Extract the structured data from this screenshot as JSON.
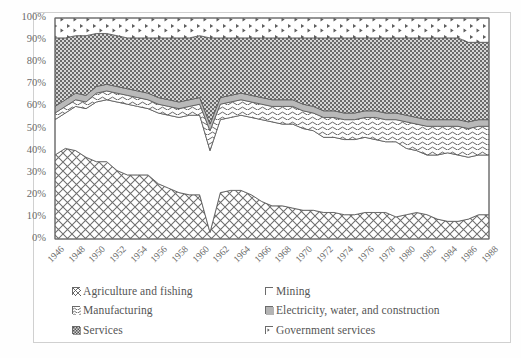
{
  "figure": {
    "background_color": "#ffffff",
    "frame_color": "#d0d0d0"
  },
  "chart_data": {
    "type": "area",
    "subtype": "stacked-percentage-area",
    "title": "",
    "xlabel": "",
    "ylabel": "",
    "ylim": [
      0,
      100
    ],
    "ytick_labels": [
      "0%",
      "10%",
      "20%",
      "30%",
      "40%",
      "50%",
      "60%",
      "70%",
      "80%",
      "90%",
      "100%"
    ],
    "ytick_values": [
      0,
      10,
      20,
      30,
      40,
      50,
      60,
      70,
      80,
      90,
      100
    ],
    "grid": false,
    "legend_position": "bottom",
    "x": [
      1946,
      1947,
      1948,
      1949,
      1950,
      1951,
      1952,
      1953,
      1954,
      1955,
      1956,
      1957,
      1958,
      1959,
      1960,
      1961,
      1962,
      1963,
      1964,
      1965,
      1966,
      1967,
      1968,
      1969,
      1970,
      1971,
      1972,
      1973,
      1974,
      1975,
      1976,
      1977,
      1978,
      1979,
      1980,
      1981,
      1982,
      1983,
      1984,
      1985,
      1986,
      1987,
      1988
    ],
    "xtick_labels": [
      "1946",
      "1948",
      "1950",
      "1952",
      "1954",
      "1956",
      "1958",
      "1960",
      "1962",
      "1964",
      "1966",
      "1968",
      "1970",
      "1972",
      "1974",
      "1976",
      "1978",
      "1980",
      "1982",
      "1984",
      "1986",
      "1988"
    ],
    "series": [
      {
        "name": "Agriculture and fishing",
        "pattern": "diagonal-cross-hatch",
        "color": "#ffffff",
        "values": [
          38,
          41,
          40,
          37,
          35,
          35,
          31,
          29,
          29,
          29,
          25,
          23,
          21,
          20,
          20,
          3,
          21,
          22,
          22,
          20,
          17,
          15,
          15,
          14,
          13,
          13,
          12,
          12,
          11,
          11,
          12,
          12,
          12,
          10,
          11,
          12,
          11,
          9,
          8,
          8,
          9,
          11,
          11
        ]
      },
      {
        "name": "Mining",
        "pattern": "solid-white",
        "color": "#ffffff",
        "values": [
          16,
          16,
          20,
          22,
          27,
          28,
          31,
          32,
          31,
          30,
          32,
          33,
          34,
          36,
          36,
          37,
          33,
          33,
          34,
          35,
          37,
          38,
          37,
          38,
          37,
          36,
          34,
          34,
          34,
          34,
          34,
          33,
          32,
          34,
          30,
          28,
          27,
          29,
          31,
          30,
          28,
          27,
          27
        ]
      },
      {
        "name": "Manufacturing",
        "pattern": "wavy-lines",
        "color": "#fdfdfd",
        "values": [
          3,
          3,
          3,
          3,
          4,
          4,
          4,
          4,
          4,
          4,
          4,
          4,
          4,
          4,
          5,
          9,
          7,
          7,
          7,
          7,
          7,
          7,
          8,
          8,
          8,
          8,
          9,
          9,
          9,
          9,
          9,
          10,
          10,
          10,
          12,
          12,
          13,
          13,
          12,
          13,
          13,
          13,
          13
        ]
      },
      {
        "name": "Electricity, water, and construction",
        "pattern": "solid-gray",
        "color": "#b8b8b8",
        "values": [
          3,
          3,
          3,
          3,
          3,
          3,
          3,
          3,
          3,
          3,
          3,
          3,
          3,
          3,
          3,
          3,
          3,
          3,
          3,
          3,
          3,
          3,
          3,
          3,
          3,
          3,
          3,
          3,
          3,
          3,
          3,
          3,
          3,
          3,
          3,
          3,
          3,
          3,
          3,
          3,
          3,
          3,
          3
        ]
      },
      {
        "name": "Services",
        "pattern": "dense-checker",
        "color": "#9a9a9a",
        "values": [
          31,
          28,
          26,
          27,
          24,
          23,
          23,
          23,
          24,
          25,
          27,
          28,
          29,
          28,
          28,
          39,
          27,
          26,
          25,
          26,
          27,
          28,
          28,
          28,
          30,
          31,
          33,
          33,
          34,
          34,
          33,
          33,
          34,
          34,
          35,
          36,
          37,
          37,
          37,
          37,
          36,
          35,
          35
        ]
      },
      {
        "name": "Government services",
        "pattern": "sparse-speckle",
        "color": "#ffffff",
        "values": [
          9,
          9,
          8,
          8,
          7,
          7,
          8,
          9,
          9,
          9,
          9,
          9,
          9,
          9,
          8,
          9,
          9,
          9,
          9,
          9,
          9,
          9,
          9,
          9,
          9,
          9,
          9,
          9,
          9,
          9,
          9,
          9,
          9,
          9,
          9,
          9,
          9,
          9,
          9,
          9,
          11,
          11,
          11
        ]
      }
    ]
  },
  "legend": {
    "columns": [
      {
        "items": [
          {
            "label": "Agriculture and fishing",
            "swatch": "diagonal-cross-hatch"
          },
          {
            "label": "Manufacturing",
            "swatch": "wavy-lines"
          },
          {
            "label": "Services",
            "swatch": "dense-checker"
          }
        ]
      },
      {
        "items": [
          {
            "label": "Mining",
            "swatch": "solid-white"
          },
          {
            "label": "Electricity, water, and construction",
            "swatch": "solid-gray"
          },
          {
            "label": "Government services",
            "swatch": "sparse-speckle"
          }
        ]
      }
    ]
  }
}
